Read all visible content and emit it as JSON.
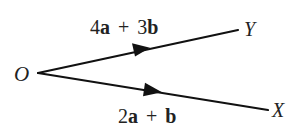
{
  "diagram": {
    "type": "vector-diagram",
    "stroke_color": "#111111",
    "text_color": "#222222",
    "background": "#ffffff",
    "points": {
      "origin": {
        "label": "O",
        "x": 38,
        "y": 73
      },
      "Y": {
        "label": "Y",
        "x": 238,
        "y": 30
      },
      "X": {
        "label": "X",
        "x": 268,
        "y": 110
      }
    },
    "vectors": [
      {
        "id": "OY",
        "from": "O",
        "to": "Y",
        "label": {
          "coef1": "4",
          "v1": "a",
          "op": "+",
          "coef2": "3",
          "v2": "b"
        },
        "label_text": "4a + 3b",
        "arrow_direction": "O-to-Y"
      },
      {
        "id": "OX",
        "from": "O",
        "to": "X",
        "label": {
          "coef1": "2",
          "v1": "a",
          "op": "+",
          "coef2": "",
          "v2": "b"
        },
        "label_text": "2a + b",
        "arrow_direction": "O-to-X"
      }
    ]
  }
}
